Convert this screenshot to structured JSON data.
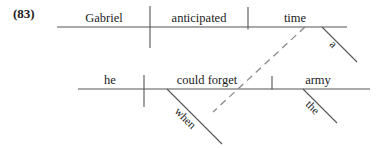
{
  "figure": {
    "example_number": "(83)",
    "type": "reed-kellogg sentence diagram",
    "sentence": "Gabriel anticipated a time when he could forget the army"
  },
  "main_clause": {
    "subject": "Gabriel",
    "verb": "anticipated",
    "object": "time",
    "object_modifier": "a"
  },
  "subordinate_clause": {
    "subject": "he",
    "verb": "could forget",
    "object": "army",
    "object_modifier": "the",
    "connector": "when"
  },
  "style": {
    "line_color": "#555555",
    "text_color": "#1c1c1c",
    "background": "#ffffff",
    "line_width": 1,
    "dash_pattern": "7 5"
  },
  "geometry": {
    "top_baseline": {
      "x1": 57,
      "y1": 27,
      "x2": 347,
      "y2": 27
    },
    "bottom_baseline": {
      "x1": 78,
      "y1": 89,
      "x2": 370,
      "y2": 89
    },
    "top_subject_verb_divider": {
      "x": 150,
      "y1": 6,
      "y2": 48
    },
    "top_verb_object_divider": {
      "x": 248,
      "y1": 7,
      "y2": 30
    },
    "bottom_subject_verb_divider": {
      "x": 144,
      "y1": 75,
      "y2": 107
    },
    "bottom_verb_object_divider": {
      "x": 272,
      "y1": 76,
      "y2": 90
    },
    "modifier_a_line": {
      "x1": 322,
      "y1": 27,
      "x2": 357,
      "y2": 62
    },
    "modifier_the_line": {
      "x1": 303,
      "y1": 89,
      "x2": 337,
      "y2": 123
    },
    "connector_when_line": {
      "x1": 167,
      "y1": 89,
      "x2": 222,
      "y2": 144
    },
    "dashed_link_line": {
      "x1": 305,
      "y1": 27,
      "x2": 213,
      "y2": 112
    }
  }
}
